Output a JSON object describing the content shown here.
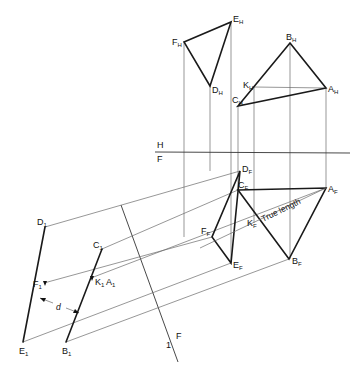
{
  "diagram": {
    "title": "",
    "fold_lines": {
      "hf": {
        "upper_label": "H",
        "lower_label": "F"
      },
      "f1": {
        "label_left": "1",
        "label_right": "F"
      }
    },
    "labels": {
      "EH": {
        "base": "E",
        "sub": "H"
      },
      "FH": {
        "base": "F",
        "sub": "H"
      },
      "DH": {
        "base": "D",
        "sub": "H"
      },
      "BH": {
        "base": "B",
        "sub": "H"
      },
      "AH": {
        "base": "A",
        "sub": "H"
      },
      "KH": {
        "base": "K",
        "sub": "H"
      },
      "CH": {
        "base": "C",
        "sub": "H"
      },
      "DF": {
        "base": "D",
        "sub": "F"
      },
      "FF": {
        "base": "F",
        "sub": "F"
      },
      "EF": {
        "base": "E",
        "sub": "F"
      },
      "CF": {
        "base": "C",
        "sub": "F"
      },
      "AF": {
        "base": "A",
        "sub": "F"
      },
      "KF": {
        "base": "K",
        "sub": "F"
      },
      "BF": {
        "base": "B",
        "sub": "F"
      },
      "D1": {
        "base": "D",
        "sub": "1"
      },
      "E1": {
        "base": "E",
        "sub": "1"
      },
      "F1": {
        "base": "F",
        "sub": "1"
      },
      "C1": {
        "base": "C",
        "sub": "1"
      },
      "B1": {
        "base": "B",
        "sub": "1"
      },
      "K1": {
        "base": "K",
        "sub": "1"
      },
      "A1": {
        "base": "A",
        "sub": "1"
      }
    },
    "annotations": {
      "true_length": "True length",
      "distance": "d"
    }
  }
}
